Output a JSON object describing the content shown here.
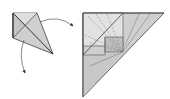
{
  "diagram": {
    "type": "origami-folding-step",
    "colors": {
      "paper_light": "#e4e4e4",
      "paper_mid": "#cfcfcf",
      "paper_dark": "#bdbdbd",
      "edge": "#555555",
      "crease": "#777777",
      "arrow": "#333333"
    },
    "left_figure": {
      "label": "kite-base"
    },
    "right_figure": {
      "label": "folded-triangle"
    }
  }
}
